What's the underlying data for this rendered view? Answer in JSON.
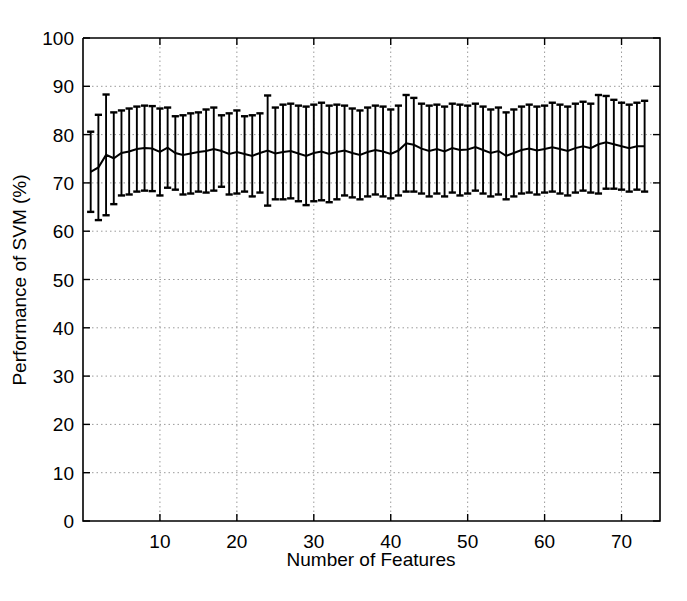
{
  "chart_data": {
    "type": "line",
    "title": "",
    "xlabel": "Number of Features",
    "ylabel": "Performance of SVM (%)",
    "xlim": [
      0,
      75
    ],
    "ylim": [
      0,
      100
    ],
    "xticks": [
      10,
      20,
      30,
      40,
      50,
      60,
      70
    ],
    "xtick_labels": [
      "10",
      "20",
      "30",
      "40",
      "50",
      "60",
      "70"
    ],
    "yticks": [
      0,
      10,
      20,
      30,
      40,
      50,
      60,
      70,
      80,
      90,
      100
    ],
    "ytick_labels": [
      "0",
      "10",
      "20",
      "30",
      "40",
      "50",
      "60",
      "70",
      "80",
      "90",
      "100"
    ],
    "grid": true,
    "grid_style": "dotted",
    "legend": null,
    "error_bars": true,
    "error_bar_style": "capped-vertical",
    "line_color": "#000000",
    "background_color": "#ffffff",
    "x": [
      1,
      2,
      3,
      4,
      5,
      6,
      7,
      8,
      9,
      10,
      11,
      12,
      13,
      14,
      15,
      16,
      17,
      18,
      19,
      20,
      21,
      22,
      23,
      24,
      25,
      26,
      27,
      28,
      29,
      30,
      31,
      32,
      33,
      34,
      35,
      36,
      37,
      38,
      39,
      40,
      41,
      42,
      43,
      44,
      45,
      46,
      47,
      48,
      49,
      50,
      51,
      52,
      53,
      54,
      55,
      56,
      57,
      58,
      59,
      60,
      61,
      62,
      63,
      64,
      65,
      66,
      67,
      68,
      69,
      70,
      71,
      72,
      73
    ],
    "series": [
      {
        "name": "Performance of SVM",
        "values": [
          72.3,
          73.2,
          75.8,
          75.1,
          76.2,
          76.5,
          77.0,
          77.2,
          77.1,
          76.4,
          77.3,
          76.2,
          75.8,
          76.1,
          76.4,
          76.6,
          77.0,
          76.6,
          76.0,
          76.4,
          76.0,
          75.6,
          76.2,
          76.7,
          76.1,
          76.4,
          76.6,
          76.1,
          75.6,
          76.2,
          76.5,
          76.0,
          76.4,
          76.7,
          76.2,
          75.8,
          76.4,
          76.8,
          76.5,
          76.0,
          76.7,
          78.2,
          77.9,
          77.1,
          76.6,
          77.0,
          76.5,
          77.2,
          76.8,
          76.9,
          77.4,
          76.8,
          76.2,
          76.6,
          75.6,
          76.2,
          76.8,
          77.1,
          76.7,
          77.0,
          77.4,
          77.0,
          76.6,
          77.2,
          77.6,
          77.2,
          78.0,
          78.4,
          78.0,
          77.6,
          77.2,
          77.6,
          77.6
        ],
        "err_upper": [
          80.6,
          84.1,
          88.3,
          84.6,
          85.0,
          85.4,
          85.8,
          86.0,
          85.9,
          85.4,
          85.6,
          83.8,
          84.0,
          84.4,
          84.6,
          85.2,
          85.6,
          84.0,
          84.4,
          85.0,
          83.8,
          84.0,
          84.4,
          88.1,
          85.6,
          86.2,
          86.4,
          86.0,
          85.8,
          86.2,
          86.6,
          86.0,
          86.2,
          86.0,
          85.4,
          85.0,
          85.6,
          86.0,
          85.8,
          85.2,
          86.0,
          88.2,
          87.6,
          86.4,
          86.0,
          86.2,
          85.8,
          86.4,
          86.2,
          86.0,
          86.4,
          85.8,
          85.2,
          85.6,
          84.6,
          85.2,
          85.8,
          86.2,
          85.8,
          86.0,
          86.6,
          86.2,
          85.8,
          86.4,
          86.8,
          86.4,
          88.2,
          88.0,
          87.2,
          86.6,
          86.2,
          86.6,
          87.0
        ],
        "err_lower": [
          64.0,
          62.3,
          63.3,
          65.6,
          67.4,
          67.6,
          68.2,
          68.4,
          68.3,
          67.4,
          69.0,
          68.6,
          67.6,
          67.8,
          68.2,
          68.0,
          68.4,
          69.2,
          67.6,
          67.8,
          68.2,
          67.2,
          68.0,
          65.3,
          66.6,
          66.6,
          66.8,
          66.2,
          65.4,
          66.2,
          66.4,
          66.0,
          66.6,
          67.4,
          67.0,
          66.6,
          67.2,
          67.6,
          67.2,
          66.8,
          67.4,
          68.2,
          68.2,
          67.8,
          67.2,
          67.8,
          67.2,
          68.0,
          67.4,
          67.8,
          68.4,
          67.8,
          67.2,
          67.6,
          66.6,
          67.2,
          67.8,
          68.0,
          67.6,
          68.0,
          68.2,
          67.8,
          67.4,
          68.0,
          68.4,
          68.0,
          67.8,
          68.8,
          68.8,
          68.6,
          68.2,
          68.6,
          68.2
        ]
      }
    ]
  },
  "axes": {
    "ylabel": "Performance of SVM (%)",
    "xlabel": "Number of Features"
  }
}
